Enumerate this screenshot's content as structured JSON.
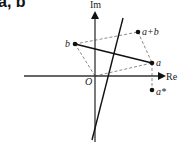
{
  "title": "a, b",
  "diagram": {
    "axes": {
      "x_label": "Re",
      "y_label": "Im",
      "origin_label": "O"
    },
    "points": [
      {
        "id": "a",
        "label": "a"
      },
      {
        "id": "b",
        "label": "b"
      },
      {
        "id": "a_plus_b",
        "label": "a+b"
      },
      {
        "id": "a_conj",
        "label": "a*"
      }
    ],
    "colors": {
      "line": "#111111",
      "dashed": "#888888"
    }
  }
}
